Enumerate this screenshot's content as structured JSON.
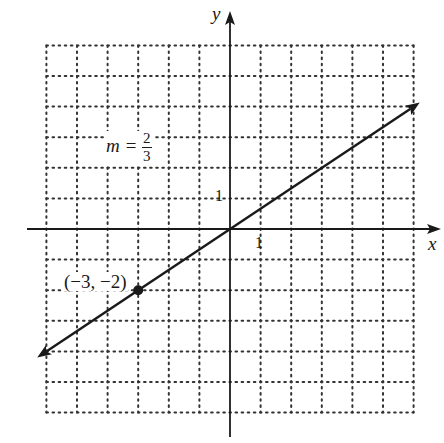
{
  "chart_data": {
    "type": "line",
    "title": "",
    "xlabel": "x",
    "ylabel": "y",
    "xlim": [
      -6,
      6
    ],
    "ylim": [
      -6,
      6
    ],
    "grid": true,
    "grid_style": "dotted",
    "tick_labels": {
      "x": [
        "1"
      ],
      "y": [
        "1"
      ]
    },
    "series": [
      {
        "name": "line with slope 2/3 through origin",
        "equation": "y = (2/3)x",
        "slope": "2/3",
        "x": [
          -6.3,
          -3,
          0,
          6.2
        ],
        "y": [
          -4.2,
          -2,
          0,
          4.13
        ],
        "arrows": "both ends"
      }
    ],
    "points": [
      {
        "x": -3,
        "y": -2,
        "label": "(−3, −2)"
      }
    ],
    "annotations": [
      {
        "text": "m = 2/3",
        "x": -3.5,
        "y": 2.7
      }
    ]
  },
  "labels": {
    "x_axis": "x",
    "y_axis": "y",
    "x_tick": "1",
    "y_tick": "1",
    "point": "(−3, −2)",
    "slope_prefix": "m = ",
    "slope_num": "2",
    "slope_den": "3"
  },
  "colors": {
    "ink": "#1a1a1a",
    "grid": "#333333",
    "background": "#ffffff"
  }
}
